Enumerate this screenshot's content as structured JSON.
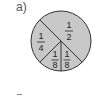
{
  "label": "a)",
  "circle": {
    "fill": "#c8c8c8",
    "stroke": "#333333",
    "sections": [
      {
        "name": "half",
        "numerator": "1",
        "denominator": "2"
      },
      {
        "name": "quarter",
        "numerator": "1",
        "denominator": "4"
      },
      {
        "name": "eighth-left",
        "numerator": "1",
        "denominator": "8"
      },
      {
        "name": "eighth-right",
        "numerator": "1",
        "denominator": "8"
      }
    ]
  }
}
